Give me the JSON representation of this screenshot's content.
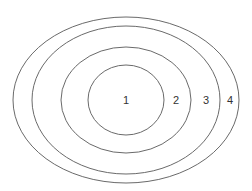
{
  "diagram": {
    "type": "nested-ellipses",
    "stroke_color": "#6a6a6a",
    "label_color": "#333333",
    "rings": [
      {
        "label": "1",
        "cx": 126,
        "cy": 100,
        "rx": 38,
        "ry": 35,
        "label_x": 126,
        "label_y": 101
      },
      {
        "label": "2",
        "cx": 126,
        "cy": 100,
        "rx": 65,
        "ry": 53,
        "label_x": 176,
        "label_y": 101
      },
      {
        "label": "3",
        "cx": 126,
        "cy": 100,
        "rx": 94,
        "ry": 74,
        "label_x": 206,
        "label_y": 101
      },
      {
        "label": "4",
        "cx": 126,
        "cy": 100,
        "rx": 113,
        "ry": 83,
        "label_x": 230,
        "label_y": 101
      }
    ]
  }
}
